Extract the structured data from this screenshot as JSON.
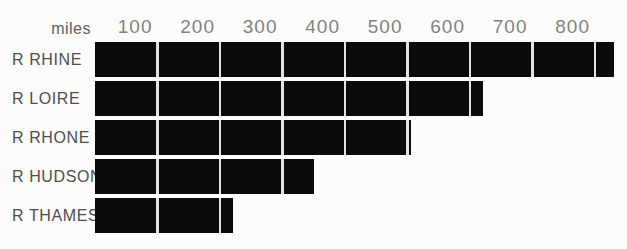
{
  "chart_data": {
    "type": "bar",
    "orientation": "horizontal",
    "title": "",
    "unit_label": "miles",
    "categories": [
      "R RHINE",
      "R LOIRE",
      "R RHONE",
      "R HUDSON",
      "R THAMES"
    ],
    "values": [
      830,
      620,
      505,
      350,
      220
    ],
    "x_ticks": [
      "100",
      "200",
      "300",
      "400",
      "500",
      "600",
      "700",
      "800"
    ],
    "xlim": [
      0,
      850
    ],
    "legend": "none",
    "grid": "white vertical lines over bars at each 100 miles",
    "colors": {
      "background": "#fcfcfb",
      "bar": "#0b0b0b",
      "gridline": "#e4e4e2",
      "category_label": "#4e4e4e",
      "tick_label": "#828282",
      "unit_label": "#606060"
    }
  }
}
